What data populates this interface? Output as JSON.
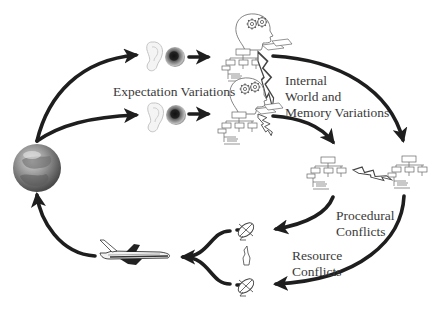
{
  "diagram": {
    "labels": {
      "expectation": "Expectation Variations",
      "internal_line1": "Internal",
      "internal_line2": "World and",
      "internal_line3": "Memory Variations",
      "procedural_line1": "Procedural",
      "procedural_line2": "Conflicts",
      "resource_line1": "Resource",
      "resource_line2": "Conflicts"
    },
    "nodes": [
      {
        "id": "globe",
        "icon": "globe-icon"
      },
      {
        "id": "ear-top",
        "icon": "ear-icon"
      },
      {
        "id": "eye-top",
        "icon": "eye-icon"
      },
      {
        "id": "ear-bottom",
        "icon": "ear-icon"
      },
      {
        "id": "eye-bottom",
        "icon": "eye-icon"
      },
      {
        "id": "head-top",
        "icon": "head-gears-icon"
      },
      {
        "id": "head-bottom",
        "icon": "head-gears-icon"
      },
      {
        "id": "orgchart-left",
        "icon": "org-chart-icon"
      },
      {
        "id": "orgchart-right",
        "icon": "org-chart-icon"
      },
      {
        "id": "dish-top",
        "icon": "satellite-dish-icon"
      },
      {
        "id": "dish-bottom",
        "icon": "satellite-dish-icon"
      },
      {
        "id": "airplane",
        "icon": "airplane-icon"
      }
    ],
    "colors": {
      "arrow": "#1e1e1e",
      "text": "#3a3a3a"
    }
  }
}
